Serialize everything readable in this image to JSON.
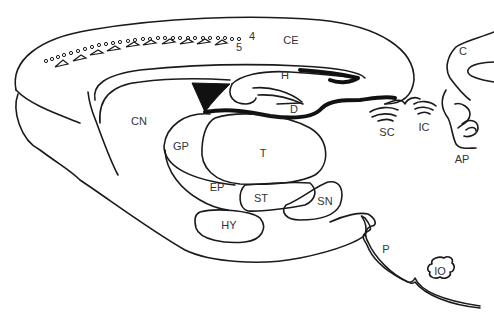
{
  "diagram": {
    "type": "sagittal brain section line drawing",
    "colors": {
      "line": "#1a1a1a",
      "fill": "#ffffff",
      "label": "#333333"
    },
    "labels": [
      {
        "id": "CE",
        "text": "CE",
        "x": 291,
        "y": 40
      },
      {
        "id": "layer4",
        "text": "4",
        "x": 252,
        "y": 36
      },
      {
        "id": "layer5",
        "text": "5",
        "x": 239,
        "y": 47
      },
      {
        "id": "H",
        "text": "H",
        "x": 285,
        "y": 75
      },
      {
        "id": "D",
        "text": "D",
        "x": 294,
        "y": 109
      },
      {
        "id": "CN",
        "text": "CN",
        "x": 139,
        "y": 121
      },
      {
        "id": "GP",
        "text": "GP",
        "x": 181,
        "y": 146
      },
      {
        "id": "T",
        "text": "T",
        "x": 263,
        "y": 153
      },
      {
        "id": "EP",
        "text": "EP",
        "x": 217,
        "y": 187
      },
      {
        "id": "ST",
        "text": "ST",
        "x": 261,
        "y": 198
      },
      {
        "id": "SN",
        "text": "SN",
        "x": 325,
        "y": 201
      },
      {
        "id": "HY",
        "text": "HY",
        "x": 229,
        "y": 225
      },
      {
        "id": "SC",
        "text": "SC",
        "x": 387,
        "y": 132
      },
      {
        "id": "IC",
        "text": "IC",
        "x": 424,
        "y": 127
      },
      {
        "id": "C",
        "text": "C",
        "x": 463,
        "y": 51
      },
      {
        "id": "AP",
        "text": "AP",
        "x": 462,
        "y": 159
      },
      {
        "id": "P",
        "text": "P",
        "x": 386,
        "y": 249
      },
      {
        "id": "IO",
        "text": "IO",
        "x": 440,
        "y": 271
      }
    ]
  }
}
